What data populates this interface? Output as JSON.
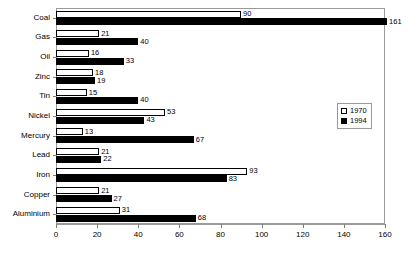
{
  "chart_data": {
    "type": "bar",
    "orientation": "horizontal",
    "title": "",
    "subtitle": "",
    "xlabel": "",
    "ylabel": "",
    "xlim": [
      0,
      160
    ],
    "xticks": [
      0,
      20,
      40,
      60,
      80,
      100,
      120,
      140,
      160
    ],
    "grid": false,
    "legend_position": "right",
    "categories": [
      "Coal",
      "Gas",
      "Oil",
      "Zinc",
      "Tin",
      "Nickel",
      "Mercury",
      "Lead",
      "Iron",
      "Copper",
      "Aluminium"
    ],
    "series": [
      {
        "name": "1970",
        "style": "open",
        "color": "#ffffff",
        "border": "#000000",
        "values": [
          90,
          21,
          16,
          18,
          15,
          53,
          13,
          21,
          93,
          21,
          31
        ]
      },
      {
        "name": "1994",
        "style": "filled",
        "color": "#000000",
        "border": "#000000",
        "values": [
          161,
          40,
          33,
          19,
          40,
          43,
          67,
          22,
          83,
          27,
          68
        ]
      }
    ]
  },
  "legend": {
    "entries": [
      {
        "label": "1970",
        "swatch": "open-square-icon"
      },
      {
        "label": "1994",
        "swatch": "filled-square-icon"
      }
    ]
  },
  "axis": {
    "x_tick_labels": [
      "0",
      "20",
      "40",
      "60",
      "80",
      "100",
      "120",
      "140",
      "160"
    ]
  },
  "colors": {
    "series_1970": "#ffffff",
    "series_1994": "#000000",
    "frame": "#9a9a9a",
    "text": "#000000",
    "background": "#ffffff"
  }
}
